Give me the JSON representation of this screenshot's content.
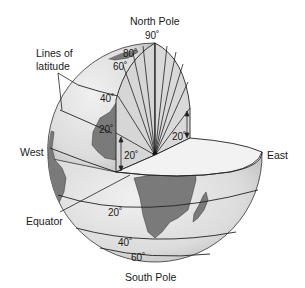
{
  "diagram": {
    "type": "cutaway-globe",
    "labels": {
      "north_pole": "North Pole",
      "south_pole": "South Pole",
      "west": "West",
      "east": "East",
      "equator": "Equator",
      "lines_of_latitude_line1": "Lines of",
      "lines_of_latitude_line2": "latitude"
    },
    "degree_labels": {
      "north_90": "90˚",
      "north_80": "80˚",
      "north_60": "60˚",
      "north_40": "40˚",
      "north_20": "20˚",
      "angle_left": "20˚",
      "angle_right": "20˚",
      "south_20": "20˚",
      "south_40": "40˚",
      "south_60": "60˚"
    },
    "colors": {
      "globe_fill": "#e4e4e4",
      "globe_shade": "#cfcfcf",
      "land_fill": "#7a7a7a",
      "cut_face": "#d6d6d6",
      "equator_disc": "#f2f2f2",
      "line": "#222222"
    }
  }
}
